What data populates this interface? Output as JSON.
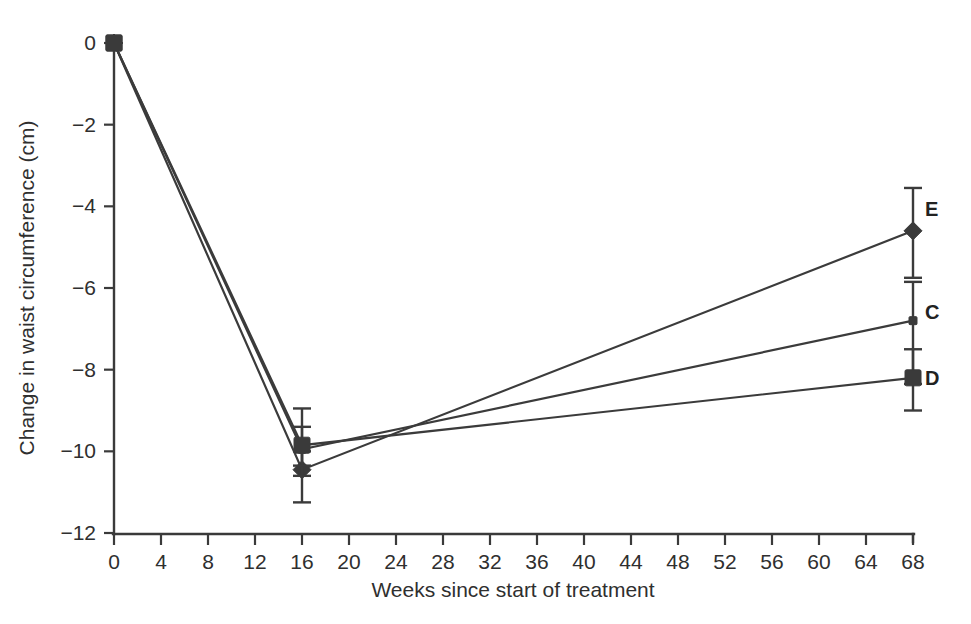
{
  "chart_data": {
    "type": "line",
    "title": "",
    "xlabel": "Weeks since start of treatment",
    "ylabel": "Change in waist circumference (cm)",
    "xlim": [
      0,
      68
    ],
    "ylim": [
      -12,
      0
    ],
    "grid": false,
    "legend_position": "right-inline-labels",
    "xticks": [
      0,
      4,
      8,
      12,
      16,
      20,
      24,
      28,
      32,
      36,
      40,
      44,
      48,
      52,
      56,
      60,
      64,
      68
    ],
    "xticklabels": [
      "0",
      "4",
      "8",
      "12",
      "16",
      "20",
      "24",
      "28",
      "32",
      "36",
      "40",
      "44",
      "48",
      "52",
      "56",
      "60",
      "64",
      "68"
    ],
    "yticks": [
      0,
      -2,
      -4,
      -6,
      -8,
      -10,
      -12
    ],
    "yticklabels": [
      "0",
      "−2",
      "−4",
      "−6",
      "−8",
      "−10",
      "−12"
    ],
    "x": [
      0,
      16,
      68
    ],
    "series": [
      {
        "name": "E",
        "label": "E",
        "marker": "diamond",
        "values": [
          0,
          -10.45,
          -4.6
        ],
        "errors": [
          {
            "x": 0,
            "y": 0,
            "low": 0,
            "high": 0
          },
          {
            "x": 16,
            "y": -10.45,
            "low": -11.25,
            "high": -10.0
          },
          {
            "x": 68,
            "y": -4.6,
            "low": -5.75,
            "high": -3.55
          }
        ]
      },
      {
        "name": "C",
        "label": "C",
        "marker": "small-square",
        "values": [
          0,
          -9.95,
          -6.8
        ],
        "errors": [
          {
            "x": 0,
            "y": 0,
            "low": 0,
            "high": 0
          },
          {
            "x": 16,
            "y": -9.95,
            "low": -10.6,
            "high": -9.4
          },
          {
            "x": 68,
            "y": -6.8,
            "low": -8.35,
            "high": -5.85
          }
        ]
      },
      {
        "name": "D",
        "label": "D",
        "marker": "square",
        "values": [
          0,
          -9.85,
          -8.2
        ],
        "errors": [
          {
            "x": 0,
            "y": 0,
            "low": 0,
            "high": 0
          },
          {
            "x": 16,
            "y": -9.85,
            "low": -10.35,
            "high": -8.95
          },
          {
            "x": 68,
            "y": -8.2,
            "low": -9.0,
            "high": -7.5
          }
        ]
      }
    ],
    "colors": {
      "line": "#3b3b3b",
      "axis": "#3a3a3a",
      "text": "#2f2f2f",
      "background": "#ffffff"
    }
  },
  "series_labels": {
    "e": "E",
    "c": "C",
    "d": "D"
  }
}
